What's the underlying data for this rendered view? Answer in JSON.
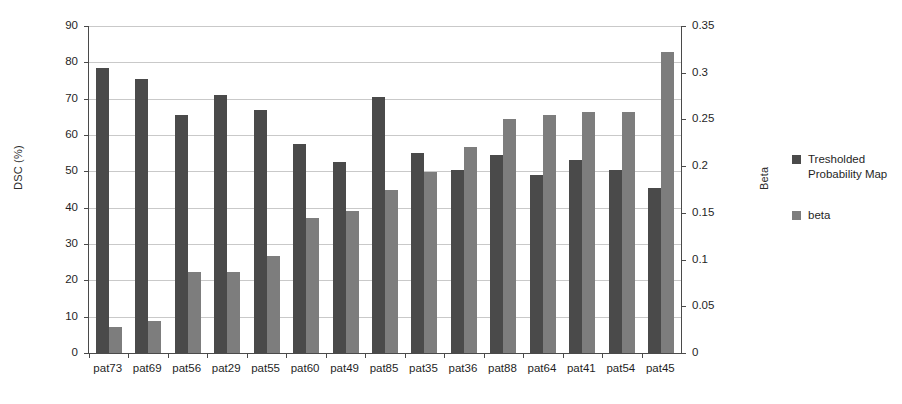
{
  "chart_data": {
    "type": "bar",
    "title": "",
    "xlabel": "",
    "ylabel": "DSC (%)",
    "y2label": "Beta",
    "ylim": [
      0,
      90
    ],
    "y2lim": [
      0,
      0.35
    ],
    "yticks": [
      "0",
      "10",
      "20",
      "30",
      "40",
      "50",
      "60",
      "70",
      "80",
      "90"
    ],
    "y2ticks": [
      "0",
      "0.05",
      "0.1",
      "0.15",
      "0.2",
      "0.25",
      "0.3",
      "0.35"
    ],
    "grid": true,
    "legend_position": "right",
    "categories": [
      "pat73",
      "pat69",
      "pat56",
      "pat29",
      "pat55",
      "pat60",
      "pat49",
      "pat85",
      "pat35",
      "pat36",
      "pat88",
      "pat64",
      "pat41",
      "pat54",
      "pat45"
    ],
    "series": [
      {
        "name": "Tresholded Probability Map",
        "axis": "left",
        "color": "#4a4a4a",
        "values": [
          78.5,
          75.5,
          65.5,
          71.0,
          67.0,
          57.5,
          52.5,
          70.5,
          55.0,
          50.5,
          54.5,
          49.0,
          53.0,
          50.5,
          45.5
        ]
      },
      {
        "name": "beta",
        "axis": "right",
        "color": "#7d7d7d",
        "values": [
          0.028,
          0.034,
          0.087,
          0.087,
          0.104,
          0.145,
          0.152,
          0.174,
          0.194,
          0.22,
          0.25,
          0.255,
          0.258,
          0.258,
          0.322
        ]
      }
    ]
  },
  "legend": {
    "items": [
      {
        "label": "Tresholded Probability Map"
      },
      {
        "label": "beta"
      }
    ]
  }
}
